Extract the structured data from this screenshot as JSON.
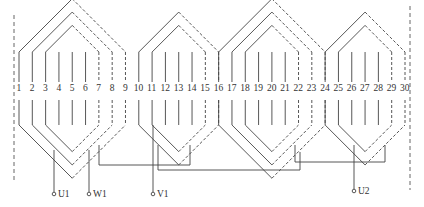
{
  "diagram": {
    "title": "",
    "slot_count": 30,
    "slot_x_first": 19,
    "slot_x_last": 405,
    "slot_label_y": 91,
    "slot_labels": [
      "1",
      "2",
      "3",
      "4",
      "5",
      "6",
      "7",
      "8",
      "9",
      "10",
      "11",
      "12",
      "13",
      "14",
      "15",
      "16",
      "17",
      "18",
      "19",
      "20",
      "21",
      "22",
      "23",
      "24",
      "25",
      "26",
      "27",
      "28",
      "29",
      "30"
    ],
    "colors": {
      "line": "#444444",
      "text": "#333333",
      "background": "#ffffff"
    },
    "coil_groups": [
      {
        "name": "group-1",
        "coils": [
          {
            "left": 1,
            "right": 9
          },
          {
            "left": 2,
            "right": 8
          },
          {
            "left": 3,
            "right": 7
          }
        ]
      },
      {
        "name": "group-2",
        "coils": [
          {
            "left": 10,
            "right": 16
          },
          {
            "left": 11,
            "right": 15
          }
        ]
      },
      {
        "name": "group-3",
        "coils": [
          {
            "left": 16,
            "right": 24
          },
          {
            "left": 17,
            "right": 23
          },
          {
            "left": 18,
            "right": 22
          }
        ]
      },
      {
        "name": "group-4",
        "coils": [
          {
            "left": 24,
            "right": 30
          },
          {
            "left": 25,
            "right": 29
          }
        ]
      }
    ],
    "terminals": [
      {
        "id": "U1",
        "label": "U1",
        "x": 54
      },
      {
        "id": "W1",
        "label": "W1",
        "x": 89
      },
      {
        "id": "V1",
        "label": "V1",
        "x": 153
      },
      {
        "id": "U2",
        "label": "U2",
        "x": 354
      }
    ]
  }
}
